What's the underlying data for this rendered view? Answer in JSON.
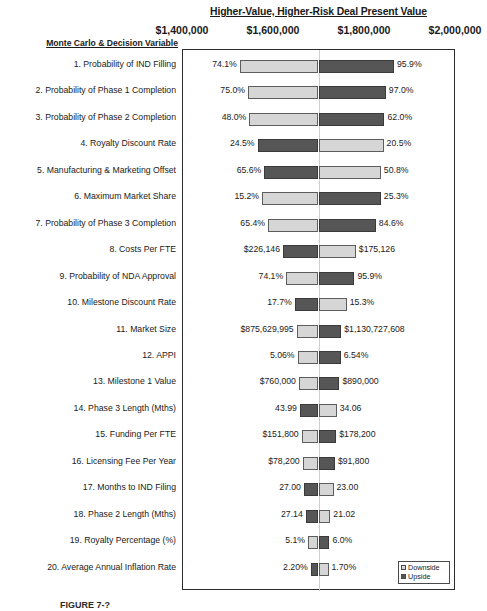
{
  "chart_data": {
    "type": "bar",
    "subtype": "tornado",
    "title": "Higher-Value, Higher-Risk Deal Present Value",
    "xlabel": "",
    "ylabel": "Monte Carlo & Decision Variable",
    "xlim": [
      1400000,
      2000000
    ],
    "grid": true,
    "legend_position": "bottom-right",
    "axis_ticks": [
      {
        "label": "$1,400,000",
        "value": 1400000
      },
      {
        "label": "$1,600,000",
        "value": 1600000
      },
      {
        "label": "$1,800,000",
        "value": 1800000
      },
      {
        "label": "$2,000,000",
        "value": 2000000
      }
    ],
    "legend": [
      {
        "name": "Downside",
        "color": "#d6d6d6"
      },
      {
        "name": "Upside",
        "color": "#565656"
      }
    ],
    "base_value": 1700000,
    "categories": [
      "1. Probability of IND Filling",
      "2. Probability of Phase 1 Completion",
      "3. Probability of Phase 2 Completion",
      "4. Royalty Discount Rate",
      "5. Manufacturing & Marketing Offset",
      "6. Maximum Market Share",
      "7. Probability of Phase 3 Completion",
      "8. Costs Per FTE",
      "9. Probability of NDA Approval",
      "10. Milestone Discount Rate",
      "11. Market Size",
      "12. APPI",
      "13. Milestone 1 Value",
      "14. Phase 3 Length (Mths)",
      "15. Funding Per FTE",
      "16. Licensing Fee Per Year",
      "17. Months to IND Filing",
      "18. Phase 2 Length (Mths)",
      "19. Royalty Percentage (%)",
      "20. Average Annual Inflation Rate"
    ],
    "rows": [
      {
        "label": "1. Probability of IND Filling",
        "low_label": "74.1%",
        "high_label": "95.9%",
        "low_value": 1527000,
        "high_value": 1866000,
        "low_side_color": "#d6d6d6",
        "high_side_color": "#565656"
      },
      {
        "label": "2. Probability of Phase 1 Completion",
        "low_label": "75.0%",
        "high_label": "97.0%",
        "low_value": 1545000,
        "high_value": 1848000,
        "low_side_color": "#d6d6d6",
        "high_side_color": "#565656"
      },
      {
        "label": "3. Probability of Phase 2 Completion",
        "low_label": "48.0%",
        "high_label": "62.0%",
        "low_value": 1548000,
        "high_value": 1845000,
        "low_side_color": "#d6d6d6",
        "high_side_color": "#565656"
      },
      {
        "label": "4. Royalty Discount Rate",
        "low_label": "24.5%",
        "high_label": "20.5%",
        "low_value": 1566000,
        "high_value": 1843000,
        "low_side_color": "#565656",
        "high_side_color": "#d6d6d6"
      },
      {
        "label": "5. Manufacturing & Marketing Offset",
        "low_label": "65.6%",
        "high_label": "50.8%",
        "low_value": 1581000,
        "high_value": 1837000,
        "low_side_color": "#565656",
        "high_side_color": "#d6d6d6"
      },
      {
        "label": "6. Maximum Market Share",
        "low_label": "15.2%",
        "high_label": "25.3%",
        "low_value": 1576000,
        "high_value": 1837000,
        "low_side_color": "#d6d6d6",
        "high_side_color": "#565656"
      },
      {
        "label": "7. Probability of Phase 3 Completion",
        "low_label": "65.4%",
        "high_label": "84.6%",
        "low_value": 1589000,
        "high_value": 1826000,
        "low_side_color": "#d6d6d6",
        "high_side_color": "#565656"
      },
      {
        "label": "8. Costs Per FTE",
        "low_label": "$226,146",
        "high_label": "$175,126",
        "low_value": 1622000,
        "high_value": 1782000,
        "low_side_color": "#565656",
        "high_side_color": "#d6d6d6"
      },
      {
        "label": "9. Probability of NDA Approval",
        "low_label": "74.1%",
        "high_label": "95.9%",
        "low_value": 1629000,
        "high_value": 1779000,
        "low_side_color": "#d6d6d6",
        "high_side_color": "#565656"
      },
      {
        "label": "10. Milestone Discount Rate",
        "low_label": "17.7%",
        "high_label": "15.3%",
        "low_value": 1648000,
        "high_value": 1762000,
        "low_side_color": "#565656",
        "high_side_color": "#d6d6d6"
      },
      {
        "label": "11. Market Size",
        "low_label": "$875,629,995",
        "high_label": "$1,130,727,608",
        "low_value": 1652000,
        "high_value": 1750000,
        "low_side_color": "#d6d6d6",
        "high_side_color": "#565656"
      },
      {
        "label": "12. APPI",
        "low_label": "5.06%",
        "high_label": "6.54%",
        "low_value": 1654000,
        "high_value": 1749000,
        "low_side_color": "#d6d6d6",
        "high_side_color": "#565656"
      },
      {
        "label": "13. Milestone 1 Value",
        "low_label": "$760,000",
        "high_label": "$890,000",
        "low_value": 1657000,
        "high_value": 1746000,
        "low_side_color": "#d6d6d6",
        "high_side_color": "#565656"
      },
      {
        "label": "14. Phase 3 Length (Mths)",
        "low_label": "43.99",
        "high_label": "34.06",
        "low_value": 1659000,
        "high_value": 1740000,
        "low_side_color": "#565656",
        "high_side_color": "#d6d6d6"
      },
      {
        "label": "15. Funding Per FTE",
        "low_label": "$151,800",
        "high_label": "$178,200",
        "low_value": 1663000,
        "high_value": 1739000,
        "low_side_color": "#d6d6d6",
        "high_side_color": "#565656"
      },
      {
        "label": "16. Licensing Fee Per Year",
        "low_label": "$78,200",
        "high_label": "$91,800",
        "low_value": 1665000,
        "high_value": 1736000,
        "low_side_color": "#d6d6d6",
        "high_side_color": "#565656"
      },
      {
        "label": "17. Months to IND Filing",
        "low_label": "27.00",
        "high_label": "23.00",
        "low_value": 1668000,
        "high_value": 1733000,
        "low_side_color": "#565656",
        "high_side_color": "#d6d6d6"
      },
      {
        "label": "18. Phase 2 Length (Mths)",
        "low_label": "27.14",
        "high_label": "21.02",
        "low_value": 1672000,
        "high_value": 1726000,
        "low_side_color": "#565656",
        "high_side_color": "#d6d6d6"
      },
      {
        "label": "19. Royalty Percentage (%)",
        "low_label": "5.1%",
        "high_label": "6.0%",
        "low_value": 1677000,
        "high_value": 1724000,
        "low_side_color": "#d6d6d6",
        "high_side_color": "#565656"
      },
      {
        "label": "20. Average Annual Inflation Rate",
        "low_label": "2.20%",
        "high_label": "1.70%",
        "low_value": 1683000,
        "high_value": 1722000,
        "low_side_color": "#565656",
        "high_side_color": "#d6d6d6"
      }
    ]
  },
  "caption": {
    "figure_number": "FIGURE 7-?"
  }
}
